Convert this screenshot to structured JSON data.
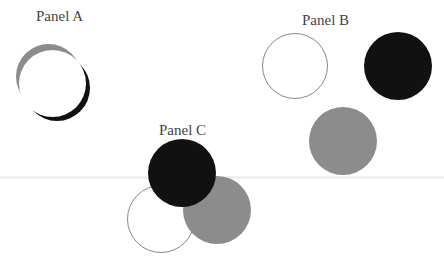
{
  "panels": {
    "a": {
      "label": "Panel A",
      "circles": [
        {
          "name": "gray",
          "color": "#8c8c8c"
        },
        {
          "name": "black",
          "color": "#111111"
        },
        {
          "name": "white",
          "color": "#ffffff"
        }
      ]
    },
    "b": {
      "label": "Panel B",
      "circles": [
        {
          "name": "white",
          "color": "#ffffff"
        },
        {
          "name": "black",
          "color": "#111111"
        },
        {
          "name": "gray",
          "color": "#8c8c8c"
        }
      ]
    },
    "c": {
      "label": "Panel C",
      "circles": [
        {
          "name": "white",
          "color": "#ffffff"
        },
        {
          "name": "gray",
          "color": "#8c8c8c"
        },
        {
          "name": "black",
          "color": "#111111"
        }
      ]
    }
  }
}
